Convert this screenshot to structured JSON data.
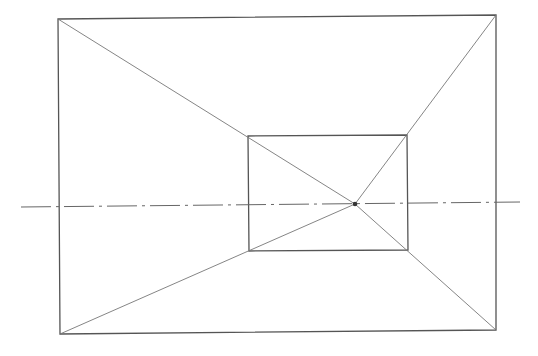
{
  "diagram": {
    "type": "one-point-perspective",
    "colors": {
      "line": "#555555",
      "construction": "#777777",
      "background": "#ffffff"
    },
    "outer_rect": {
      "tl": [
        58,
        19
      ],
      "tr": [
        496,
        15
      ],
      "br": [
        496,
        330
      ],
      "bl": [
        60,
        334
      ]
    },
    "inner_rect": {
      "tl": [
        248,
        136
      ],
      "tr": [
        407,
        135
      ],
      "br": [
        408,
        250
      ],
      "bl": [
        249,
        251
      ]
    },
    "vanishing_point": [
      355,
      204
    ],
    "horizon_line": {
      "from": [
        21,
        207
      ],
      "to": [
        520,
        202
      ],
      "style": "dash-dot"
    }
  }
}
